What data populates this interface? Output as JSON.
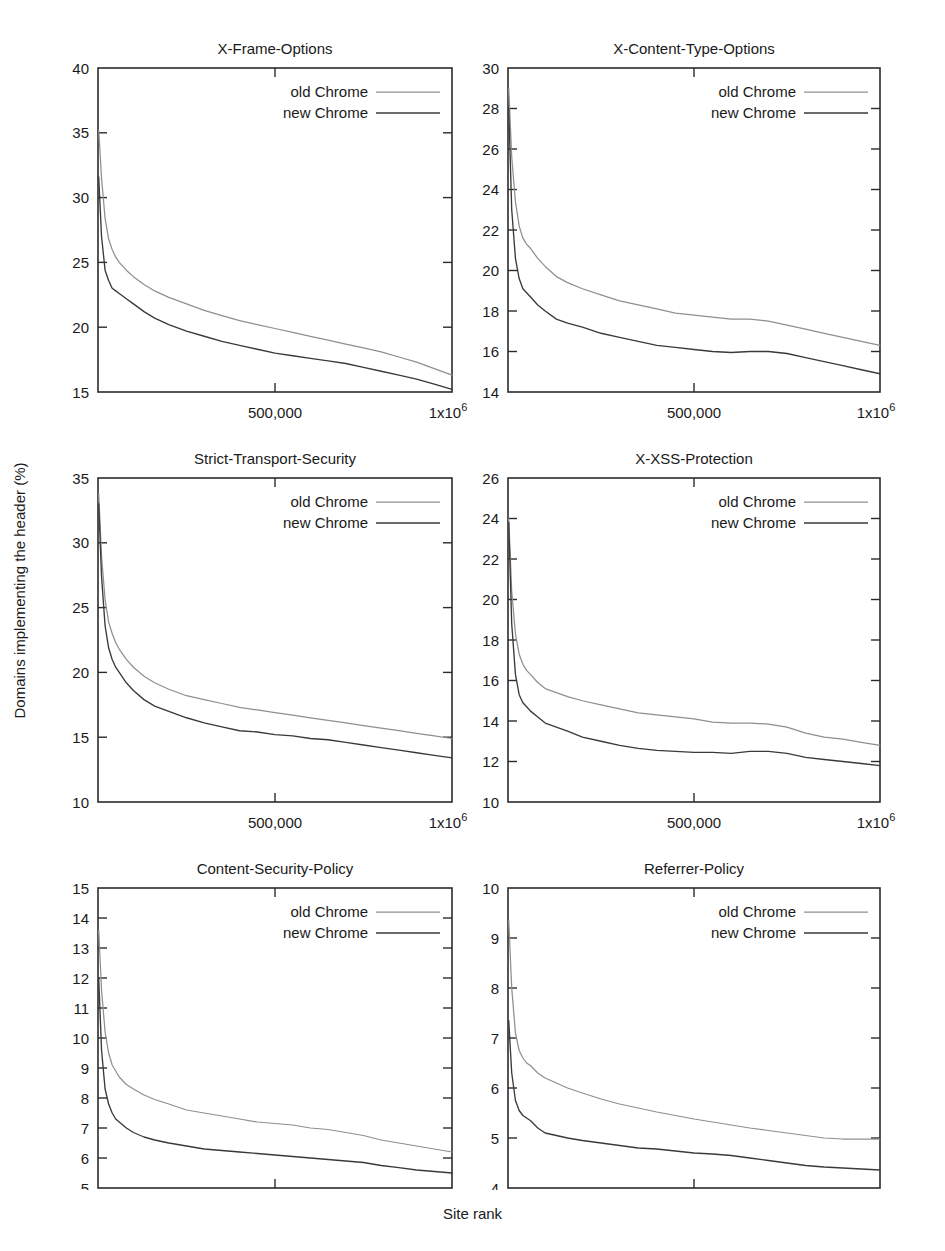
{
  "figure": {
    "ylabel": "Domains implementing the header (%)",
    "xlabel": "Site rank"
  },
  "legend": {
    "old_label": "old  Chrome",
    "new_label": "new Chrome",
    "old_color": "#8f8f8f",
    "new_color": "#3a3a3a"
  },
  "xticks": {
    "mid_label": "500,000",
    "end_label_base": "1x10",
    "end_label_exp": "6"
  },
  "chart_data": [
    {
      "type": "line",
      "title": "X-Frame-Options",
      "xlabel": "Site rank",
      "ylabel": "Domains implementing the header (%)",
      "xlim": [
        0,
        1000000
      ],
      "ylim": [
        15,
        40
      ],
      "yticks": [
        15,
        20,
        25,
        30,
        35,
        40
      ],
      "xticks": [
        500000,
        1000000
      ],
      "grid": false,
      "legend_position": "top-right",
      "x": [
        2000,
        10000,
        20000,
        30000,
        40000,
        50000,
        60000,
        80000,
        100000,
        130000,
        160000,
        200000,
        250000,
        300000,
        350000,
        400000,
        450000,
        500000,
        550000,
        600000,
        650000,
        700000,
        750000,
        800000,
        850000,
        900000,
        950000,
        1000000
      ],
      "series": [
        {
          "name": "old  Chrome",
          "values": [
            35.2,
            31.5,
            28.4,
            26.8,
            26.0,
            25.4,
            25.0,
            24.4,
            23.9,
            23.3,
            22.8,
            22.3,
            21.8,
            21.3,
            20.9,
            20.5,
            20.2,
            19.9,
            19.6,
            19.3,
            19.0,
            18.7,
            18.4,
            18.1,
            17.7,
            17.3,
            16.8,
            16.3
          ]
        },
        {
          "name": "new Chrome",
          "values": [
            31.6,
            27.0,
            24.4,
            23.6,
            23.0,
            22.8,
            22.6,
            22.2,
            21.8,
            21.2,
            20.7,
            20.2,
            19.7,
            19.3,
            18.9,
            18.6,
            18.3,
            18.0,
            17.8,
            17.6,
            17.4,
            17.2,
            16.9,
            16.6,
            16.3,
            16.0,
            15.6,
            15.2
          ]
        }
      ]
    },
    {
      "type": "line",
      "title": "X-Content-Type-Options",
      "xlabel": "Site rank",
      "ylabel": "Domains implementing the header (%)",
      "xlim": [
        0,
        1000000
      ],
      "ylim": [
        14,
        30
      ],
      "yticks": [
        14,
        16,
        18,
        20,
        22,
        24,
        26,
        28,
        30
      ],
      "xticks": [
        500000,
        1000000
      ],
      "grid": false,
      "legend_position": "top-right",
      "x": [
        2000,
        10000,
        20000,
        30000,
        40000,
        50000,
        60000,
        80000,
        100000,
        130000,
        160000,
        200000,
        250000,
        300000,
        350000,
        400000,
        450000,
        500000,
        550000,
        600000,
        650000,
        700000,
        750000,
        800000,
        850000,
        900000,
        950000,
        1000000
      ],
      "series": [
        {
          "name": "old  Chrome",
          "values": [
            29.0,
            25.6,
            23.4,
            22.2,
            21.6,
            21.3,
            21.1,
            20.6,
            20.2,
            19.7,
            19.4,
            19.1,
            18.8,
            18.5,
            18.3,
            18.1,
            17.9,
            17.8,
            17.7,
            17.6,
            17.6,
            17.5,
            17.3,
            17.1,
            16.9,
            16.7,
            16.5,
            16.3
          ]
        },
        {
          "name": "new Chrome",
          "values": [
            28.0,
            23.0,
            20.6,
            19.6,
            19.1,
            18.9,
            18.7,
            18.3,
            18.0,
            17.6,
            17.4,
            17.2,
            16.9,
            16.7,
            16.5,
            16.3,
            16.2,
            16.1,
            16.0,
            15.95,
            16.0,
            16.0,
            15.9,
            15.7,
            15.5,
            15.3,
            15.1,
            14.9
          ]
        }
      ]
    },
    {
      "type": "line",
      "title": "Strict-Transport-Security",
      "xlabel": "Site rank",
      "ylabel": "Domains implementing the header (%)",
      "xlim": [
        0,
        1000000
      ],
      "ylim": [
        10,
        35
      ],
      "yticks": [
        10,
        15,
        20,
        25,
        30,
        35
      ],
      "xticks": [
        500000,
        1000000
      ],
      "grid": false,
      "legend_position": "top-right",
      "x": [
        2000,
        10000,
        20000,
        30000,
        40000,
        50000,
        60000,
        80000,
        100000,
        130000,
        160000,
        200000,
        250000,
        300000,
        350000,
        400000,
        450000,
        500000,
        550000,
        600000,
        650000,
        700000,
        750000,
        800000,
        850000,
        900000,
        950000,
        1000000
      ],
      "series": [
        {
          "name": "old  Chrome",
          "values": [
            33.8,
            29.0,
            25.6,
            23.9,
            23.0,
            22.3,
            21.8,
            21.0,
            20.4,
            19.7,
            19.2,
            18.7,
            18.2,
            17.9,
            17.6,
            17.3,
            17.1,
            16.9,
            16.7,
            16.5,
            16.3,
            16.1,
            15.9,
            15.7,
            15.5,
            15.3,
            15.1,
            14.9
          ]
        },
        {
          "name": "new Chrome",
          "values": [
            33.0,
            27.4,
            23.6,
            21.9,
            21.0,
            20.4,
            20.0,
            19.2,
            18.6,
            17.9,
            17.4,
            17.0,
            16.5,
            16.1,
            15.8,
            15.5,
            15.4,
            15.2,
            15.1,
            14.9,
            14.8,
            14.6,
            14.4,
            14.2,
            14.0,
            13.8,
            13.6,
            13.4
          ]
        }
      ]
    },
    {
      "type": "line",
      "title": "X-XSS-Protection",
      "xlabel": "Site rank",
      "ylabel": "Domains implementing the header (%)",
      "xlim": [
        0,
        1000000
      ],
      "ylim": [
        10,
        26
      ],
      "yticks": [
        10,
        12,
        14,
        16,
        18,
        20,
        22,
        24,
        26
      ],
      "xticks": [
        500000,
        1000000
      ],
      "grid": false,
      "legend_position": "top-right",
      "x": [
        2000,
        10000,
        20000,
        30000,
        40000,
        50000,
        60000,
        80000,
        100000,
        130000,
        160000,
        200000,
        250000,
        300000,
        350000,
        400000,
        450000,
        500000,
        550000,
        600000,
        650000,
        700000,
        750000,
        800000,
        850000,
        900000,
        950000,
        1000000
      ],
      "series": [
        {
          "name": "old  Chrome",
          "values": [
            24.0,
            20.4,
            18.3,
            17.3,
            16.8,
            16.5,
            16.3,
            15.9,
            15.6,
            15.4,
            15.2,
            15.0,
            14.8,
            14.6,
            14.4,
            14.3,
            14.2,
            14.1,
            13.95,
            13.9,
            13.9,
            13.85,
            13.7,
            13.4,
            13.2,
            13.1,
            12.95,
            12.8
          ]
        },
        {
          "name": "new Chrome",
          "values": [
            23.8,
            18.8,
            16.3,
            15.3,
            14.9,
            14.7,
            14.5,
            14.2,
            13.9,
            13.7,
            13.5,
            13.2,
            13.0,
            12.8,
            12.65,
            12.55,
            12.5,
            12.45,
            12.45,
            12.4,
            12.5,
            12.5,
            12.4,
            12.2,
            12.1,
            12.0,
            11.9,
            11.8
          ]
        }
      ]
    },
    {
      "type": "line",
      "title": "Content-Security-Policy",
      "xlabel": "Site rank",
      "ylabel": "Domains implementing the header (%)",
      "xlim": [
        0,
        1000000
      ],
      "ylim": [
        5,
        15
      ],
      "yticks": [
        5,
        6,
        7,
        8,
        9,
        10,
        11,
        12,
        13,
        14,
        15
      ],
      "xticks": [
        500000,
        1000000
      ],
      "grid": false,
      "legend_position": "top-right",
      "x": [
        2000,
        10000,
        20000,
        30000,
        40000,
        50000,
        60000,
        80000,
        100000,
        130000,
        160000,
        200000,
        250000,
        300000,
        350000,
        400000,
        450000,
        500000,
        550000,
        600000,
        650000,
        700000,
        750000,
        800000,
        850000,
        900000,
        950000,
        1000000
      ],
      "series": [
        {
          "name": "old  Chrome",
          "values": [
            13.6,
            11.6,
            10.2,
            9.5,
            9.1,
            8.9,
            8.7,
            8.45,
            8.3,
            8.1,
            7.95,
            7.8,
            7.6,
            7.5,
            7.4,
            7.3,
            7.2,
            7.15,
            7.1,
            7.0,
            6.95,
            6.85,
            6.75,
            6.6,
            6.5,
            6.4,
            6.3,
            6.2
          ]
        },
        {
          "name": "new Chrome",
          "values": [
            12.0,
            9.6,
            8.3,
            7.8,
            7.5,
            7.3,
            7.2,
            7.0,
            6.85,
            6.7,
            6.6,
            6.5,
            6.4,
            6.3,
            6.25,
            6.2,
            6.15,
            6.1,
            6.05,
            6.0,
            5.95,
            5.9,
            5.85,
            5.75,
            5.68,
            5.6,
            5.55,
            5.5
          ]
        }
      ]
    },
    {
      "type": "line",
      "title": "Referrer-Policy",
      "xlabel": "Site rank",
      "ylabel": "Domains implementing the header (%)",
      "xlim": [
        0,
        1000000
      ],
      "ylim": [
        4,
        10
      ],
      "yticks": [
        4,
        5,
        6,
        7,
        8,
        9,
        10
      ],
      "xticks": [
        500000,
        1000000
      ],
      "grid": false,
      "legend_position": "top-right",
      "x": [
        2000,
        10000,
        20000,
        30000,
        40000,
        50000,
        60000,
        80000,
        100000,
        130000,
        160000,
        200000,
        250000,
        300000,
        350000,
        400000,
        450000,
        500000,
        550000,
        600000,
        650000,
        700000,
        750000,
        800000,
        850000,
        900000,
        950000,
        1000000
      ],
      "series": [
        {
          "name": "old  Chrome",
          "values": [
            9.35,
            8.0,
            7.1,
            6.75,
            6.6,
            6.5,
            6.45,
            6.3,
            6.2,
            6.1,
            6.0,
            5.9,
            5.78,
            5.68,
            5.6,
            5.52,
            5.45,
            5.38,
            5.32,
            5.26,
            5.2,
            5.15,
            5.1,
            5.05,
            5.0,
            4.98,
            4.98,
            4.98
          ]
        },
        {
          "name": "new Chrome",
          "values": [
            7.35,
            6.3,
            5.75,
            5.55,
            5.45,
            5.4,
            5.35,
            5.2,
            5.1,
            5.05,
            5.0,
            4.95,
            4.9,
            4.85,
            4.8,
            4.78,
            4.74,
            4.7,
            4.68,
            4.65,
            4.6,
            4.55,
            4.5,
            4.45,
            4.42,
            4.4,
            4.38,
            4.36
          ]
        }
      ]
    }
  ]
}
